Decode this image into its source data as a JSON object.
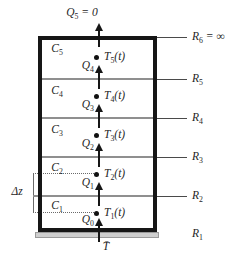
{
  "figure": {
    "title_semantics": "Layered wall lumped thermal-capacitance network",
    "top_flow": {
      "base": "Q",
      "sub": "5",
      "suffix": " = 0"
    },
    "layers": [
      {
        "cap_base": "C",
        "cap_sub": "5",
        "node_base": "T",
        "node_sub": "5",
        "node_suffix": "(t)"
      },
      {
        "cap_base": "C",
        "cap_sub": "4",
        "node_base": "T",
        "node_sub": "4",
        "node_suffix": "(t)"
      },
      {
        "cap_base": "C",
        "cap_sub": "3",
        "node_base": "T",
        "node_sub": "3",
        "node_suffix": "(t)"
      },
      {
        "cap_base": "C",
        "cap_sub": "2",
        "node_base": "T",
        "node_sub": "2",
        "node_suffix": "(t)"
      },
      {
        "cap_base": "C",
        "cap_sub": "1",
        "node_base": "T",
        "node_sub": "1",
        "node_suffix": "(t)"
      }
    ],
    "flows": [
      {
        "base": "Q",
        "sub": "4"
      },
      {
        "base": "Q",
        "sub": "3"
      },
      {
        "base": "Q",
        "sub": "2"
      },
      {
        "base": "Q",
        "sub": "1"
      },
      {
        "base": "Q",
        "sub": "0"
      }
    ],
    "resistances": [
      {
        "base": "R",
        "sub": "6",
        "suffix": " = ∞"
      },
      {
        "base": "R",
        "sub": "5",
        "suffix": ""
      },
      {
        "base": "R",
        "sub": "4",
        "suffix": ""
      },
      {
        "base": "R",
        "sub": "3",
        "suffix": ""
      },
      {
        "base": "R",
        "sub": "2",
        "suffix": ""
      },
      {
        "base": "R",
        "sub": "1",
        "suffix": ""
      }
    ],
    "delta_z": "Δz",
    "base_temperature": "T̄",
    "colors": {
      "outline": "#161616",
      "boundary_line": "#8f8f8f",
      "leader_line": "#4a4a4a",
      "plate_fill": "#cfcfcf",
      "plate_edge": "#9a9a9a",
      "text": "#1f1f1f"
    }
  }
}
